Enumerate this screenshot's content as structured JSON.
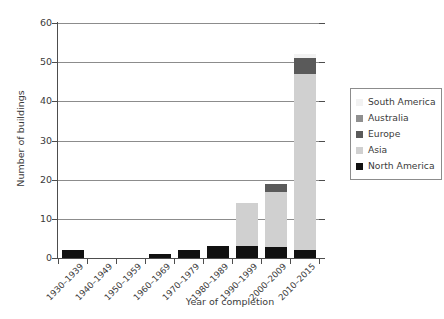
{
  "chart_data": {
    "type": "bar",
    "title": "",
    "subtitle": "",
    "xlabel": "Year of completion",
    "ylabel": "Number of buildings",
    "ylim": [
      0,
      60
    ],
    "yticks": [
      0,
      10,
      20,
      30,
      40,
      50,
      60
    ],
    "grid": true,
    "stacked": true,
    "legend_position": "right",
    "categories": [
      "1930–1939",
      "1940–1949",
      "1950–1959",
      "1960–1969",
      "1970–1979",
      "1980–1989",
      "1990–1999",
      "2000–2009",
      "2010–2015"
    ],
    "totals": [
      2,
      0,
      0,
      1,
      2,
      3,
      14,
      19,
      52
    ],
    "series": [
      {
        "name": "North America",
        "color": "#111111",
        "values": [
          2,
          0,
          0,
          1,
          2,
          3,
          3,
          3,
          2
        ]
      },
      {
        "name": "Asia",
        "color": "#d0d0d0",
        "values": [
          0,
          0,
          0,
          0,
          0,
          0,
          11,
          14,
          45
        ]
      },
      {
        "name": "Europe",
        "color": "#5a5a5a",
        "values": [
          0,
          0,
          0,
          0,
          0,
          0,
          0,
          2,
          4
        ]
      },
      {
        "name": "Australia",
        "color": "#8f8f8f",
        "values": [
          0,
          0,
          0,
          0,
          0,
          0,
          0,
          0,
          0
        ]
      },
      {
        "name": "South America",
        "color": "#f2f2f2",
        "values": [
          0,
          0,
          0,
          0,
          0,
          0,
          0,
          0,
          1
        ]
      }
    ]
  },
  "axes": {
    "ylabel": "Number of buildings",
    "xlabel": "Year of completion",
    "ytick_labels": [
      "0",
      "10",
      "20",
      "30",
      "40",
      "50",
      "60"
    ],
    "xtick_labels": [
      "1930–1939",
      "1940–1949",
      "1950–1959",
      "1960–1969",
      "1970–1979",
      "1980–1989",
      "1990–1999",
      "2000–2009",
      "2010–2015"
    ]
  },
  "legend": {
    "entries": [
      {
        "label": "South America",
        "color": "#f2f2f2"
      },
      {
        "label": "Australia",
        "color": "#8f8f8f"
      },
      {
        "label": "Europe",
        "color": "#5a5a5a"
      },
      {
        "label": "Asia",
        "color": "#d0d0d0"
      },
      {
        "label": "North America",
        "color": "#111111"
      }
    ]
  },
  "colors": {
    "axis": "#4d4d4d",
    "grid": "#8c8c8c",
    "text": "#3b3b3b",
    "background": "#ffffff"
  }
}
